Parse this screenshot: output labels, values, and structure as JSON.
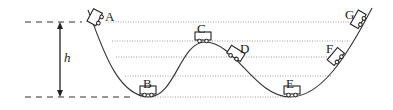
{
  "diagram": {
    "height_label": "h",
    "points": [
      {
        "id": "A",
        "label": "A",
        "x": 102,
        "y": 20,
        "angle": -55
      },
      {
        "id": "B",
        "label": "B",
        "x": 148,
        "y": 94,
        "angle": 0
      },
      {
        "id": "C",
        "label": "C",
        "x": 203,
        "y": 39,
        "angle": 0
      },
      {
        "id": "D",
        "label": "D",
        "x": 232,
        "y": 56,
        "angle": 30
      },
      {
        "id": "E",
        "label": "E",
        "x": 291,
        "y": 94,
        "angle": 0
      },
      {
        "id": "F",
        "label": "F",
        "x": 338,
        "y": 58,
        "angle": -45
      },
      {
        "id": "G",
        "label": "G",
        "x": 362,
        "y": 20,
        "angle": -60
      }
    ],
    "levels_y": [
      22,
      41,
      57,
      76,
      97
    ],
    "colors": {
      "line": "#333333",
      "dotted": "#888888"
    }
  }
}
